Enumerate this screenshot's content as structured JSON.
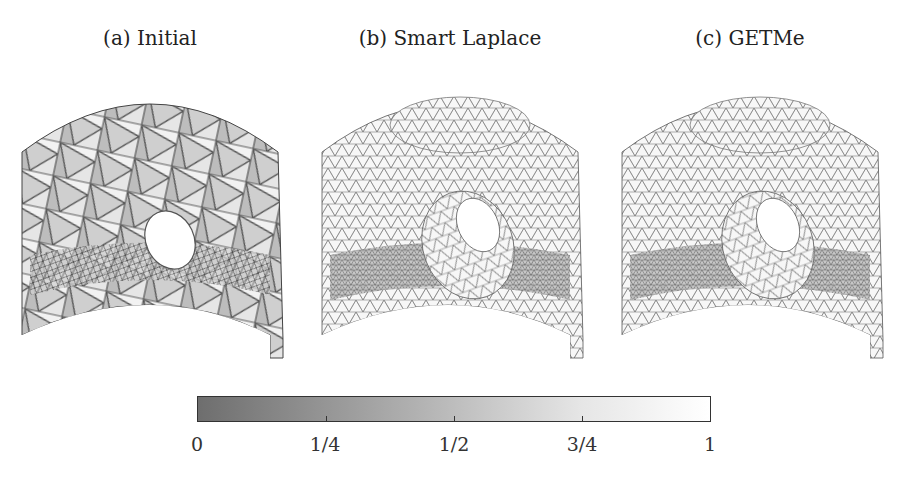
{
  "panels": [
    {
      "id": "a",
      "caption": "(a) Initial",
      "mesh": "coarse-distorted"
    },
    {
      "id": "b",
      "caption": "(b) Smart Laplace",
      "mesh": "smoothed"
    },
    {
      "id": "c",
      "caption": "(c) GETMe",
      "mesh": "smoothed"
    }
  ],
  "colorbar": {
    "ticks": [
      "0",
      "1/4",
      "1/2",
      "3/4",
      "1"
    ],
    "color_min": "#6e6e6e",
    "color_max": "#ffffff"
  }
}
